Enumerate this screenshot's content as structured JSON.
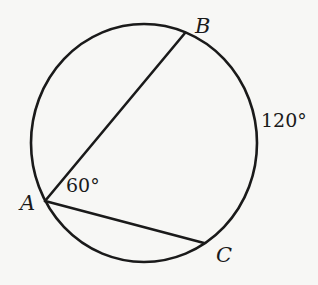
{
  "diagram": {
    "type": "circle-inscribed-angle",
    "colors": {
      "background": "#f7f7f5",
      "stroke": "#1a1a1a"
    },
    "circle": {
      "cx": 144,
      "cy": 143,
      "rx": 113,
      "ry": 119
    },
    "points": {
      "A": {
        "label": "A",
        "x": 45,
        "y": 201
      },
      "B": {
        "label": "B",
        "x": 185,
        "y": 33
      },
      "C": {
        "label": "C",
        "x": 204,
        "y": 243
      }
    },
    "chords": [
      {
        "from": "A",
        "to": "B"
      },
      {
        "from": "A",
        "to": "C"
      }
    ],
    "annotations": {
      "angle_A": "60°",
      "arc_BC": "120°"
    }
  }
}
